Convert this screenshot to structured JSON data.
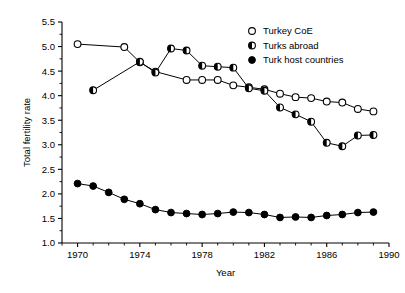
{
  "chart_data": {
    "type": "line",
    "title": "",
    "xlabel": "Year",
    "ylabel": "Total fertility rate",
    "xlim": [
      1969,
      1990
    ],
    "ylim": [
      1.0,
      5.5
    ],
    "xticks": [
      1970,
      1974,
      1978,
      1982,
      1986,
      1990
    ],
    "xtick_labels": [
      "1970",
      "1974",
      "1978",
      "1982",
      "1986",
      "1990"
    ],
    "xtick_minor_step": 1,
    "yticks": [
      1.0,
      1.5,
      2.0,
      2.5,
      3.0,
      3.5,
      4.0,
      4.5,
      5.0,
      5.5
    ],
    "ytick_labels": [
      "1.0",
      "1.5",
      "2.0",
      "2.5",
      "3.0",
      "3.5",
      "4.0",
      "4.5",
      "5.0",
      "5.5"
    ],
    "grid": false,
    "legend_position": "top-right",
    "series": [
      {
        "name": "Turkey CoE",
        "marker": "open-circle",
        "x": [
          1970,
          1973,
          1974,
          1975,
          1977,
          1978,
          1979,
          1980,
          1981,
          1982,
          1983,
          1984,
          1985,
          1986,
          1987,
          1988,
          1989
        ],
        "values": [
          5.05,
          4.99,
          4.68,
          4.49,
          4.32,
          4.32,
          4.32,
          4.21,
          4.17,
          4.13,
          4.04,
          3.97,
          3.95,
          3.88,
          3.86,
          3.73,
          3.68
        ]
      },
      {
        "name": "Turks abroad",
        "marker": "half-filled-circle",
        "x": [
          1971,
          1974,
          1975,
          1976,
          1977,
          1978,
          1979,
          1980,
          1981,
          1982,
          1983,
          1984,
          1985,
          1986,
          1987,
          1988,
          1989
        ],
        "values": [
          4.11,
          4.69,
          4.47,
          4.96,
          4.92,
          4.61,
          4.59,
          4.57,
          4.15,
          4.1,
          3.76,
          3.62,
          3.47,
          3.04,
          2.97,
          3.19,
          3.2
        ]
      },
      {
        "name": "Turk host countries",
        "marker": "filled-circle",
        "x": [
          1970,
          1971,
          1972,
          1973,
          1974,
          1975,
          1976,
          1977,
          1978,
          1979,
          1980,
          1981,
          1982,
          1983,
          1984,
          1985,
          1986,
          1987,
          1988,
          1989
        ],
        "values": [
          2.21,
          2.16,
          2.03,
          1.89,
          1.8,
          1.68,
          1.62,
          1.6,
          1.58,
          1.6,
          1.63,
          1.62,
          1.58,
          1.52,
          1.53,
          1.52,
          1.56,
          1.58,
          1.62,
          1.63
        ]
      }
    ],
    "legend": [
      {
        "label": "Turkey CoE",
        "marker": "open-circle"
      },
      {
        "label": "Turks abroad",
        "marker": "half-filled-circle"
      },
      {
        "label": "Turk host countries",
        "marker": "filled-circle"
      }
    ],
    "colors": {
      "ink": "#000000",
      "background": "#ffffff"
    }
  }
}
